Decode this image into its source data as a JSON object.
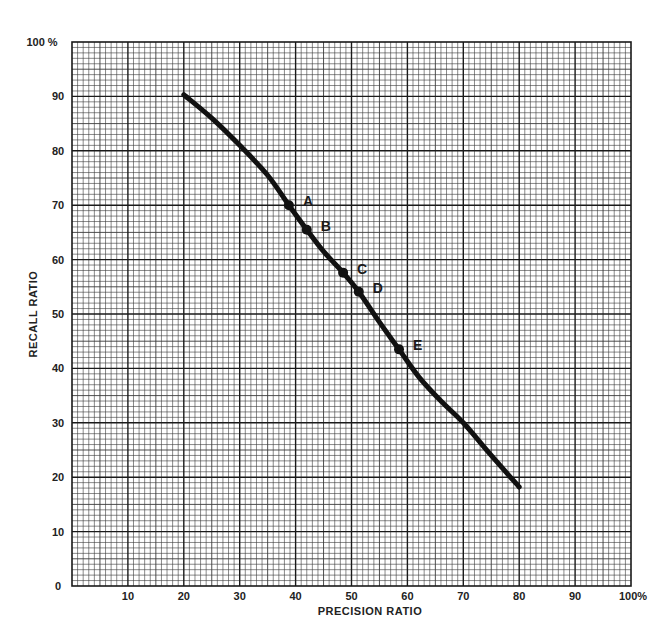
{
  "chart_data": {
    "type": "line",
    "title": "",
    "xlabel": "PRECISION RATIO",
    "ylabel": "RECALL RATIO",
    "xlim": [
      0,
      100
    ],
    "ylim": [
      0,
      100
    ],
    "grid": true,
    "x_ticks": [
      "10",
      "20",
      "30",
      "40",
      "50",
      "60",
      "70",
      "80",
      "90",
      "100%"
    ],
    "y_ticks": [
      "0",
      "10",
      "20",
      "30",
      "40",
      "50",
      "60",
      "70",
      "80",
      "90",
      "100 %"
    ],
    "series": [
      {
        "name": "recall-precision curve",
        "x": [
          20,
          25,
          30,
          35,
          38.8,
          42,
          45,
          48.5,
          51.3,
          55,
          58.5,
          62,
          66,
          70,
          75,
          80
        ],
        "y": [
          90.3,
          86,
          81,
          75.5,
          70,
          65.5,
          61.5,
          57.6,
          54.1,
          48.5,
          43.5,
          38.5,
          34,
          30,
          24,
          18.2
        ]
      }
    ],
    "annotations": [
      {
        "label": "A",
        "x": 38.8,
        "y": 70
      },
      {
        "label": "B",
        "x": 42,
        "y": 65.5
      },
      {
        "label": "C",
        "x": 48.5,
        "y": 57.6
      },
      {
        "label": "D",
        "x": 51.3,
        "y": 54.1
      },
      {
        "label": "E",
        "x": 58.5,
        "y": 43.5
      }
    ]
  },
  "colors": {
    "curve": "#111111",
    "grid_minor": "#3a3a3a",
    "grid_major": "#1a1a1a",
    "background": "#ffffff"
  }
}
